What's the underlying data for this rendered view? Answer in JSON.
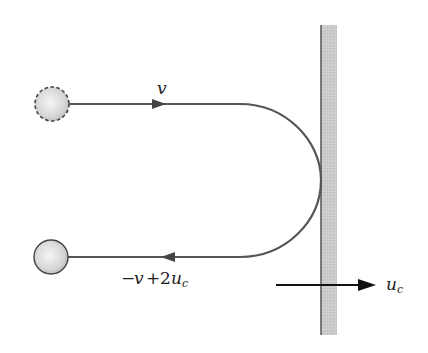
{
  "diagram": {
    "type": "elastic collision of ball with moving wall",
    "labels": {
      "incoming_velocity": "v",
      "outgoing_velocity_minus": "−",
      "outgoing_velocity_v": "v",
      "outgoing_velocity_plus": "+",
      "outgoing_velocity_2": "2",
      "outgoing_velocity_u": "u",
      "outgoing_velocity_sub": "c",
      "wall_velocity_u": "u",
      "wall_velocity_sub": "c"
    },
    "elements": {
      "initial_ball": {
        "style": "dashed outline",
        "position": "upper left"
      },
      "final_ball": {
        "style": "solid outline",
        "position": "lower left"
      },
      "wall": {
        "fill": "#c8c8c8",
        "edge": "#555555"
      },
      "trajectory": {
        "color": "#555555",
        "shape": "U-turn touching wall"
      },
      "wall_arrow": {
        "color": "#111111",
        "direction": "right"
      }
    },
    "colors": {
      "path": "#555555",
      "wall_fill": "#c9c9c9",
      "ball_light": "#f4f4f4",
      "ball_dark": "#bdbdbd",
      "arrow": "#111111"
    }
  }
}
